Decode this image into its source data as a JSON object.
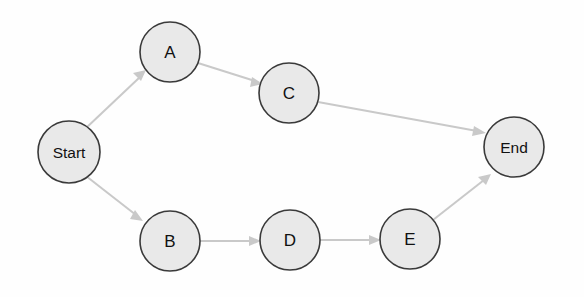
{
  "diagram": {
    "type": "directed-graph",
    "title": "",
    "background_color": "#fefefe",
    "node_fill": "#e9e9e9",
    "node_stroke": "#3a3a3a",
    "edge_color": "#c9c9c9",
    "label_color": "#111111",
    "nodes": [
      {
        "id": "start",
        "label": "Start",
        "cx": 69,
        "cy": 152,
        "r": 31
      },
      {
        "id": "a",
        "label": "A",
        "cx": 170,
        "cy": 52,
        "r": 30
      },
      {
        "id": "c",
        "label": "C",
        "cx": 289,
        "cy": 93,
        "r": 30
      },
      {
        "id": "end",
        "label": "End",
        "cx": 514,
        "cy": 147,
        "r": 30
      },
      {
        "id": "b",
        "label": "B",
        "cx": 170,
        "cy": 241,
        "r": 30
      },
      {
        "id": "d",
        "label": "D",
        "cx": 290,
        "cy": 240,
        "r": 30
      },
      {
        "id": "e",
        "label": "E",
        "cx": 410,
        "cy": 239,
        "r": 30
      }
    ],
    "edges": [
      {
        "id": "start-a",
        "from": "Start",
        "to": "A",
        "label": ""
      },
      {
        "id": "a-c",
        "from": "A",
        "to": "C",
        "label": ""
      },
      {
        "id": "c-end",
        "from": "C",
        "to": "End",
        "label": ""
      },
      {
        "id": "start-b",
        "from": "Start",
        "to": "B",
        "label": ""
      },
      {
        "id": "b-d",
        "from": "B",
        "to": "D",
        "label": ""
      },
      {
        "id": "d-e",
        "from": "D",
        "to": "E",
        "label": ""
      },
      {
        "id": "e-end",
        "from": "E",
        "to": "End",
        "label": ""
      }
    ]
  }
}
